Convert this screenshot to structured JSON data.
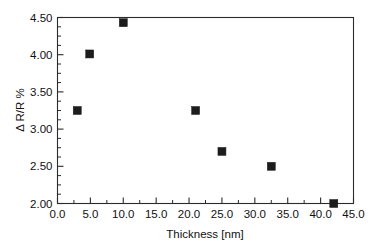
{
  "chart_data": {
    "type": "scatter",
    "title": "",
    "xlabel": "Thickness [nm]",
    "ylabel": "Δ R/R %",
    "xlim": [
      0.0,
      45.0
    ],
    "ylim": [
      2.0,
      4.5
    ],
    "xticks": [
      0.0,
      5.0,
      10.0,
      15.0,
      20.0,
      25.0,
      30.0,
      35.0,
      40.0,
      45.0
    ],
    "xticklabels": [
      "0.0",
      "5.0",
      "10.0",
      "15.0",
      "20.0",
      "25.0",
      "30.0",
      "35.0",
      "40.0",
      "45.0"
    ],
    "yticks": [
      2.0,
      2.5,
      3.0,
      3.5,
      4.0,
      4.5
    ],
    "yticklabels": [
      "2.00",
      "2.50",
      "3.00",
      "3.50",
      "4.00",
      "4.50"
    ],
    "x_minor_tick_interval": 2.5,
    "y_minor_tick_interval": 0.125,
    "grid": false,
    "legend": false,
    "marker": "square",
    "marker_color": "#1c1c1c",
    "x": [
      3.0,
      4.9,
      10.0,
      21.0,
      25.0,
      32.5,
      42.0
    ],
    "y": [
      3.25,
      4.01,
      4.43,
      3.25,
      2.7,
      2.5,
      2.0
    ],
    "points": [
      {
        "x": 3.0,
        "y": 3.25
      },
      {
        "x": 4.9,
        "y": 4.01
      },
      {
        "x": 10.0,
        "y": 4.43
      },
      {
        "x": 21.0,
        "y": 3.25
      },
      {
        "x": 25.0,
        "y": 2.7
      },
      {
        "x": 32.5,
        "y": 2.5
      },
      {
        "x": 42.0,
        "y": 2.0
      }
    ]
  }
}
